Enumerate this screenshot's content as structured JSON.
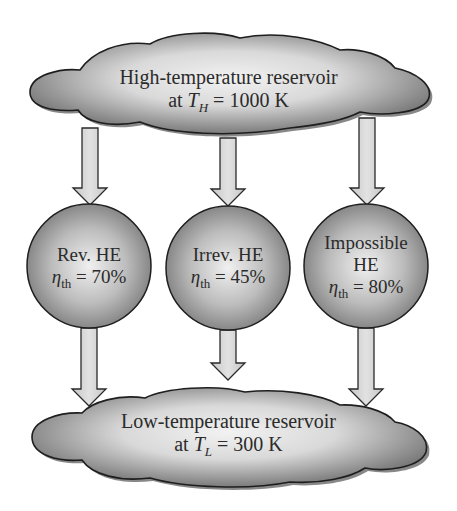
{
  "high_reservoir": {
    "line1": "High-temperature reservoir",
    "prefix": "at ",
    "var": "T",
    "var_sub": "H",
    "suffix": " = 1000 K"
  },
  "low_reservoir": {
    "line1": "Low-temperature reservoir",
    "prefix": "at ",
    "var": "T",
    "var_sub": "L",
    "suffix": " = 300 K"
  },
  "engines": [
    {
      "name_line1": "Rev. HE",
      "name_line2": "",
      "eta_symbol": "η",
      "eta_sub": "th",
      "eta_value": " = 70%"
    },
    {
      "name_line1": "Irrev. HE",
      "name_line2": "",
      "eta_symbol": "η",
      "eta_sub": "th",
      "eta_value": " = 45%"
    },
    {
      "name_line1": "Impossible",
      "name_line2": "HE",
      "eta_symbol": "η",
      "eta_sub": "th",
      "eta_value": " = 80%"
    }
  ],
  "colors": {
    "outline": "#1e1e1e",
    "shape_light": "#eeeeee",
    "shape_dark": "#6f6f6f",
    "arrow_fill": "#d4d4d4"
  }
}
